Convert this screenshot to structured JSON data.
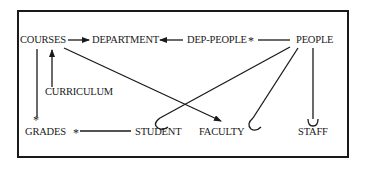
{
  "diagram": {
    "type": "entity-relationship",
    "entities": {
      "courses": "COURSES",
      "department": "DEPARTMENT",
      "dep_people": "DEP-PEOPLE",
      "people": "PEOPLE",
      "curriculum": "CURRICULUM",
      "grades": "GRADES",
      "student": "STUDENT",
      "faculty": "FACULTY",
      "staff": "STAFF"
    },
    "markers": {
      "many": "*"
    },
    "relationships": [
      {
        "from": "COURSES",
        "to": "DEPARTMENT",
        "style": "arrow"
      },
      {
        "from": "DEP-PEOPLE",
        "to": "DEPARTMENT",
        "style": "arrow"
      },
      {
        "from": "PEOPLE",
        "to": "DEP-PEOPLE",
        "style": "arrow",
        "end_marker": "*"
      },
      {
        "from": "CURRICULUM",
        "to": "COURSES",
        "style": "arrow"
      },
      {
        "from": "COURSES",
        "to": "GRADES",
        "style": "line",
        "end_marker": "*"
      },
      {
        "from": "STUDENT",
        "to": "GRADES",
        "style": "arrow",
        "end_marker": "*"
      },
      {
        "from": "COURSES",
        "to": "FACULTY",
        "style": "arrow"
      },
      {
        "from": "PEOPLE",
        "to": "STUDENT",
        "style": "subtype-hook"
      },
      {
        "from": "PEOPLE",
        "to": "FACULTY",
        "style": "subtype-hook"
      },
      {
        "from": "PEOPLE",
        "to": "STAFF",
        "style": "subtype-hook"
      }
    ]
  }
}
